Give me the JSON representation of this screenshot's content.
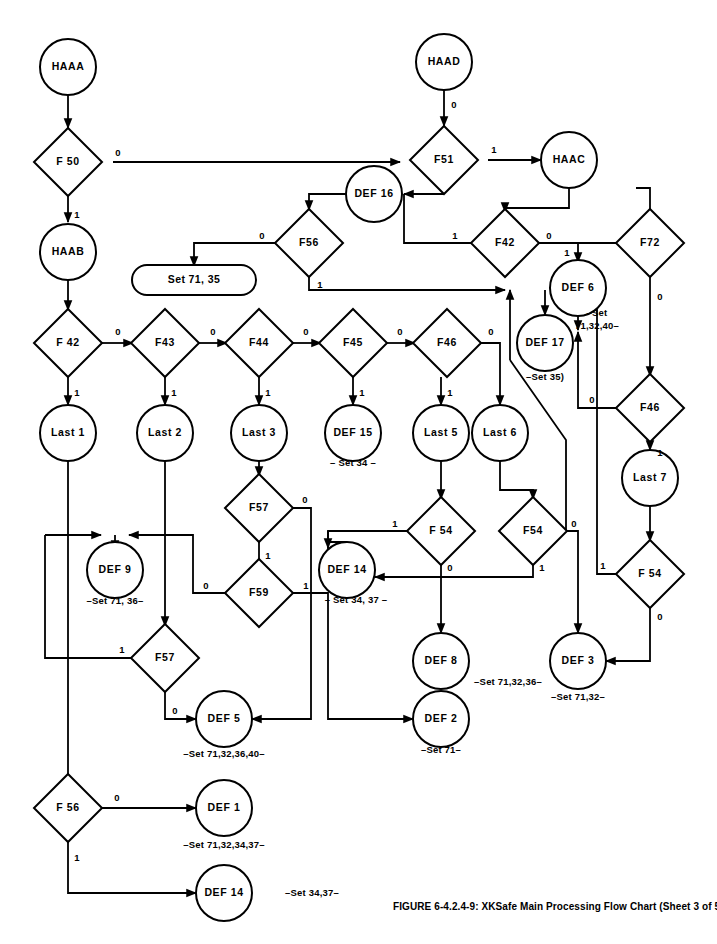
{
  "figure": {
    "caption": "FIGURE 6-4.2.4-9: XKSafe Main Processing Flow Chart (Sheet 3 of 5)",
    "colors": {
      "ink": "#000000",
      "paper": "#ffffff"
    }
  },
  "chart_data": {
    "type": "diagram",
    "title": "XKSafe Main Processing Flow Chart (Sheet 3 of 5)",
    "nodes": [
      {
        "id": "HAAA",
        "label": "HAAA",
        "shape": "circle",
        "x": 68,
        "y": 67
      },
      {
        "id": "F50",
        "label": "F 50",
        "shape": "diamond",
        "x": 68,
        "y": 162
      },
      {
        "id": "HAAB",
        "label": "HAAB",
        "shape": "circle",
        "x": 68,
        "y": 252
      },
      {
        "id": "HAAD",
        "label": "HAAD",
        "shape": "circle",
        "x": 444,
        "y": 62
      },
      {
        "id": "F51",
        "label": "F51",
        "shape": "diamond",
        "x": 444,
        "y": 160
      },
      {
        "id": "HAAC",
        "label": "HAAC",
        "shape": "circle",
        "x": 569,
        "y": 160
      },
      {
        "id": "DEF16",
        "label": "DEF 16",
        "shape": "circle",
        "x": 374,
        "y": 194
      },
      {
        "id": "F56t",
        "label": "F56",
        "shape": "diamond",
        "x": 309,
        "y": 243
      },
      {
        "id": "SET7135",
        "label": "Set 71, 35",
        "shape": "rounded",
        "x": 194,
        "y": 280
      },
      {
        "id": "F42t",
        "label": "F42",
        "shape": "diamond",
        "x": 505,
        "y": 243
      },
      {
        "id": "F72",
        "label": "F72",
        "shape": "diamond",
        "x": 650,
        "y": 243
      },
      {
        "id": "DEF6",
        "label": "DEF 6",
        "shape": "circle",
        "x": 578,
        "y": 288
      },
      {
        "id": "DEF17",
        "label": "DEF 17",
        "shape": "circle",
        "x": 545,
        "y": 343
      },
      {
        "id": "F42",
        "label": "F 42",
        "shape": "diamond",
        "x": 68,
        "y": 343
      },
      {
        "id": "F43",
        "label": "F43",
        "shape": "diamond",
        "x": 165,
        "y": 343
      },
      {
        "id": "F44",
        "label": "F44",
        "shape": "diamond",
        "x": 259,
        "y": 343
      },
      {
        "id": "F45",
        "label": "F45",
        "shape": "diamond",
        "x": 353,
        "y": 343
      },
      {
        "id": "F46a",
        "label": "F46",
        "shape": "diamond",
        "x": 447,
        "y": 343
      },
      {
        "id": "F46b",
        "label": "F46",
        "shape": "diamond",
        "x": 650,
        "y": 408
      },
      {
        "id": "LAST1",
        "label": "Last 1",
        "shape": "circle",
        "x": 68,
        "y": 433
      },
      {
        "id": "LAST2",
        "label": "Last 2",
        "shape": "circle",
        "x": 165,
        "y": 433
      },
      {
        "id": "LAST3",
        "label": "Last 3",
        "shape": "circle",
        "x": 259,
        "y": 433
      },
      {
        "id": "DEF15",
        "label": "DEF 15",
        "shape": "circle",
        "x": 353,
        "y": 433
      },
      {
        "id": "LAST5",
        "label": "Last 5",
        "shape": "circle",
        "x": 441,
        "y": 433
      },
      {
        "id": "LAST6",
        "label": "Last 6",
        "shape": "circle",
        "x": 500,
        "y": 433
      },
      {
        "id": "LAST7",
        "label": "Last 7",
        "shape": "circle",
        "x": 650,
        "y": 478
      },
      {
        "id": "F57a",
        "label": "F57",
        "shape": "diamond",
        "x": 259,
        "y": 508
      },
      {
        "id": "F54a",
        "label": "F 54",
        "shape": "diamond",
        "x": 441,
        "y": 531
      },
      {
        "id": "F54b",
        "label": "F54",
        "shape": "diamond",
        "x": 533,
        "y": 531
      },
      {
        "id": "F54c",
        "label": "F 54",
        "shape": "diamond",
        "x": 650,
        "y": 574
      },
      {
        "id": "DEF9",
        "label": "DEF 9",
        "shape": "circle",
        "x": 115,
        "y": 570
      },
      {
        "id": "F59",
        "label": "F59",
        "shape": "diamond",
        "x": 259,
        "y": 593
      },
      {
        "id": "DEF14a",
        "label": "DEF 14",
        "shape": "circle",
        "x": 347,
        "y": 570
      },
      {
        "id": "F57b",
        "label": "F57",
        "shape": "diamond",
        "x": 165,
        "y": 658
      },
      {
        "id": "DEF8",
        "label": "DEF 8",
        "shape": "circle",
        "x": 441,
        "y": 661
      },
      {
        "id": "DEF3",
        "label": "DEF 3",
        "shape": "circle",
        "x": 578,
        "y": 661
      },
      {
        "id": "DEF5",
        "label": "DEF 5",
        "shape": "circle",
        "x": 224,
        "y": 719
      },
      {
        "id": "DEF2",
        "label": "DEF 2",
        "shape": "circle",
        "x": 441,
        "y": 719
      },
      {
        "id": "F56b",
        "label": "F 56",
        "shape": "diamond",
        "x": 68,
        "y": 808
      },
      {
        "id": "DEF1",
        "label": "DEF 1",
        "shape": "circle",
        "x": 224,
        "y": 808
      },
      {
        "id": "DEF14b",
        "label": "DEF 14",
        "shape": "circle",
        "x": 224,
        "y": 893
      }
    ],
    "annotations": [
      {
        "id": "ann-def15",
        "text": "– Set 34 –",
        "x": 353,
        "y": 463
      },
      {
        "id": "ann-def6",
        "text": "–Set",
        "x": 597,
        "y": 313
      },
      {
        "id": "ann-def6b",
        "text": "71,32,40–",
        "x": 597,
        "y": 326
      },
      {
        "id": "ann-def17",
        "text": "–Set 35)",
        "x": 545,
        "y": 377
      },
      {
        "id": "ann-def9",
        "text": "–Set 71, 36–",
        "x": 115,
        "y": 601
      },
      {
        "id": "ann-def14a",
        "text": "– Set 34, 37 –",
        "x": 356,
        "y": 600
      },
      {
        "id": "ann-def8",
        "text": "–Set 71,32,36–",
        "x": 508,
        "y": 682
      },
      {
        "id": "ann-def3",
        "text": "–Set 71,32–",
        "x": 578,
        "y": 697
      },
      {
        "id": "ann-def5",
        "text": "–Set 71,32,36,40–",
        "x": 224,
        "y": 754
      },
      {
        "id": "ann-def2",
        "text": "–Set 71–",
        "x": 441,
        "y": 750
      },
      {
        "id": "ann-def1",
        "text": "–Set 71,32,34,37–",
        "x": 224,
        "y": 845
      },
      {
        "id": "ann-def14b",
        "text": "–Set 34,37–",
        "x": 312,
        "y": 893
      }
    ],
    "edge_labels": [
      {
        "id": "el-f50-0",
        "text": "0",
        "x": 118,
        "y": 153
      },
      {
        "id": "el-f50-1",
        "text": "1",
        "x": 77,
        "y": 215
      },
      {
        "id": "el-haad-0",
        "text": "0",
        "x": 454,
        "y": 105
      },
      {
        "id": "el-f51-1",
        "text": "1",
        "x": 494,
        "y": 150
      },
      {
        "id": "el-f56t-0",
        "text": "0",
        "x": 262,
        "y": 236
      },
      {
        "id": "el-f56t-1",
        "text": "1",
        "x": 320,
        "y": 285
      },
      {
        "id": "el-f42t-1",
        "text": "1",
        "x": 455,
        "y": 236
      },
      {
        "id": "el-f42t-0",
        "text": "0",
        "x": 549,
        "y": 236
      },
      {
        "id": "el-f72-1",
        "text": "1",
        "x": 567,
        "y": 253
      },
      {
        "id": "el-f72-0",
        "text": "0",
        "x": 660,
        "y": 297
      },
      {
        "id": "el-f42-0",
        "text": "0",
        "x": 118,
        "y": 332
      },
      {
        "id": "el-f42-1",
        "text": "1",
        "x": 77,
        "y": 393
      },
      {
        "id": "el-f43-0",
        "text": "0",
        "x": 213,
        "y": 332
      },
      {
        "id": "el-f43-1",
        "text": "1",
        "x": 174,
        "y": 393
      },
      {
        "id": "el-f44-0",
        "text": "0",
        "x": 306,
        "y": 332
      },
      {
        "id": "el-f44-1",
        "text": "1",
        "x": 268,
        "y": 393
      },
      {
        "id": "el-f45-0",
        "text": "0",
        "x": 400,
        "y": 332
      },
      {
        "id": "el-f45-1",
        "text": "1",
        "x": 362,
        "y": 393
      },
      {
        "id": "el-f46a-0",
        "text": "0",
        "x": 491,
        "y": 332
      },
      {
        "id": "el-f46a-1",
        "text": "1",
        "x": 450,
        "y": 393
      },
      {
        "id": "el-f46b-0",
        "text": "0",
        "x": 592,
        "y": 400
      },
      {
        "id": "el-f46b-1",
        "text": "1",
        "x": 660,
        "y": 453
      },
      {
        "id": "el-f57a-0",
        "text": "0",
        "x": 305,
        "y": 500
      },
      {
        "id": "el-f57a-1",
        "text": "1",
        "x": 268,
        "y": 556
      },
      {
        "id": "el-f59-0",
        "text": "0",
        "x": 206,
        "y": 586
      },
      {
        "id": "el-f59-1",
        "text": "1",
        "x": 306,
        "y": 586
      },
      {
        "id": "el-f57b-0",
        "text": "0",
        "x": 175,
        "y": 711
      },
      {
        "id": "el-f57b-1",
        "text": "1",
        "x": 122,
        "y": 650
      },
      {
        "id": "el-f54a-1",
        "text": "1",
        "x": 395,
        "y": 524
      },
      {
        "id": "el-f54a-0",
        "text": "0",
        "x": 450,
        "y": 568
      },
      {
        "id": "el-f54b-0",
        "text": "0",
        "x": 574,
        "y": 524
      },
      {
        "id": "el-f54b-1",
        "text": "1",
        "x": 542,
        "y": 568
      },
      {
        "id": "el-f54c-1",
        "text": "1",
        "x": 603,
        "y": 566
      },
      {
        "id": "el-f54c-0",
        "text": "0",
        "x": 660,
        "y": 617
      },
      {
        "id": "el-f56b-0",
        "text": "0",
        "x": 117,
        "y": 798
      },
      {
        "id": "el-f56b-1",
        "text": "1",
        "x": 77,
        "y": 858
      }
    ]
  }
}
